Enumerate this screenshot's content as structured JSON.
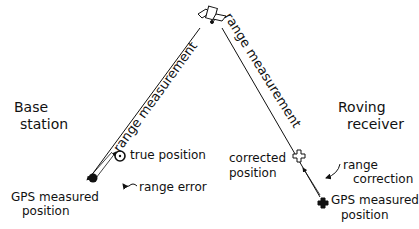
{
  "diagram": {
    "satellite": {
      "icon": "satellite-icon"
    },
    "left_station": {
      "title_line1": "Base",
      "title_line2": "station",
      "range_label": "range measurement",
      "true_position_label": "true position",
      "range_error_label": "range error",
      "measured_line1": "GPS measured",
      "measured_line2": "position"
    },
    "right_station": {
      "title_line1": "Roving",
      "title_line2": "receiver",
      "range_label": "range measurement",
      "corrected_line1": "corrected",
      "corrected_line2": "position",
      "range_correction_line1": "range",
      "range_correction_line2": "correction",
      "measured_line1": "GPS measured",
      "measured_line2": "position"
    }
  }
}
